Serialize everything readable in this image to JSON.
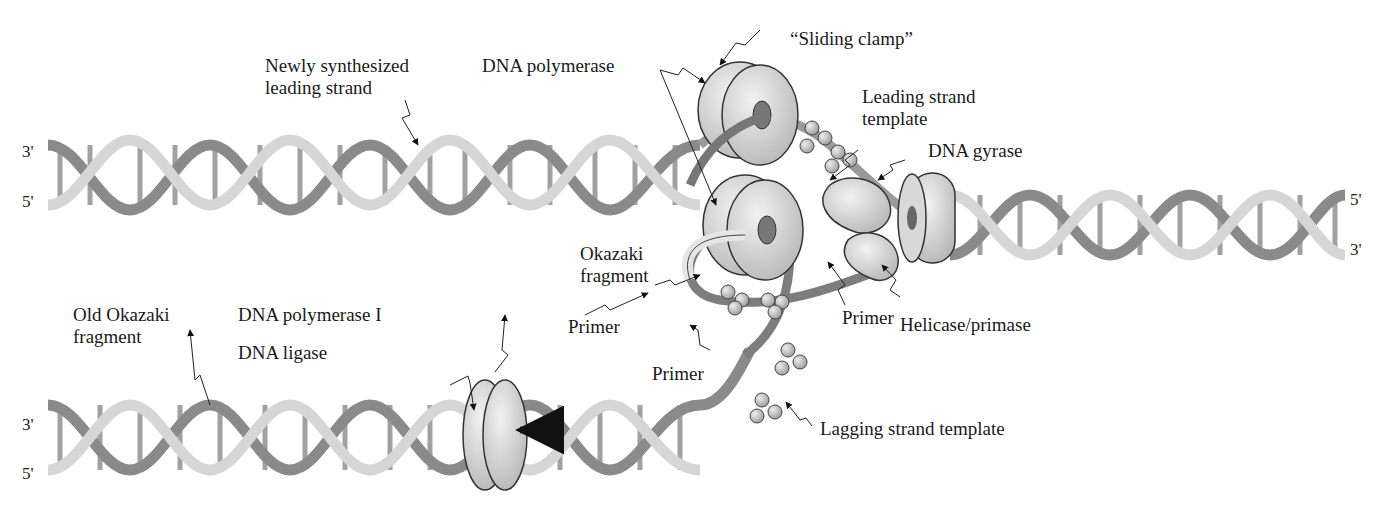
{
  "diagram": {
    "type": "DNA replication fork",
    "labels": {
      "newly_synth_leading": "Newly synthesized\nleading strand",
      "dna_polymerase": "DNA polymerase",
      "sliding_clamp": "“Sliding clamp”",
      "leading_template": "Leading strand\ntemplate",
      "dna_gyrase": "DNA gyrase",
      "okazaki_fragment": "Okazaki\nfragment",
      "primer_left": "Primer",
      "primer_mid": "Primer",
      "primer_bottom": "Primer",
      "helicase_primase": "Helicase/primase",
      "old_okazaki": "Old Okazaki\nfragment",
      "dna_polymerase_i": "DNA polymerase I",
      "dna_ligase": "DNA ligase",
      "lagging_template": "Lagging strand template"
    },
    "strand_ends": {
      "top_left_3": "3'",
      "top_left_5": "5'",
      "right_5": "5'",
      "right_3": "3'",
      "bottom_left_3": "3'",
      "bottom_left_5": "5'"
    },
    "colors": {
      "strand_light": "#d9d9d9",
      "strand_dark": "#8a8a8a",
      "protein": "#cfcfcf",
      "outline": "#333333"
    }
  }
}
